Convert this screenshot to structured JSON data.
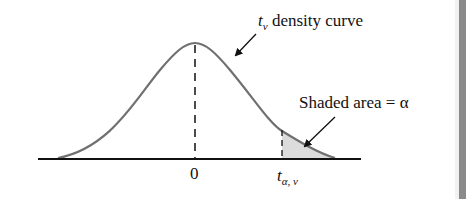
{
  "diagram": {
    "colors": {
      "curve": "#707070",
      "axis": "#111111",
      "shade": "#dcdcdc",
      "dash": "#111111",
      "edge_strip": "#8a8a8a"
    },
    "labels": {
      "curve_label_t": "t",
      "curve_label_sub": "ν",
      "curve_label_text": " density curve",
      "shaded_label": "Shaded area = α",
      "zero_tick": "0",
      "critical_t": "t",
      "critical_sub": "α, ν"
    },
    "annotations": [
      {
        "text": "t_ν density curve",
        "arrow_to": "curve right shoulder"
      },
      {
        "text": "Shaded area = α",
        "arrow_to": "right tail shaded region"
      }
    ]
  }
}
